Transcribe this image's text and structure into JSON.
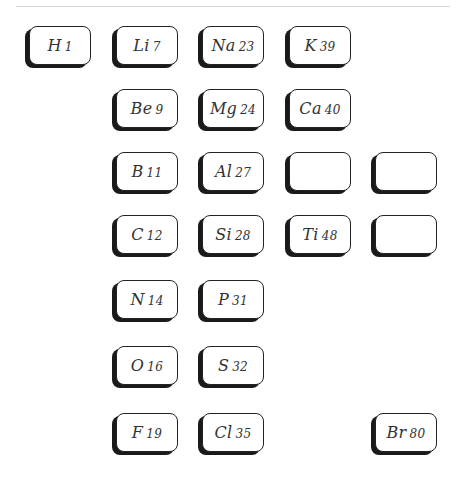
{
  "grid": {
    "col_x": [
      29,
      116,
      202,
      289,
      375
    ],
    "row_y": [
      26,
      89,
      152,
      215,
      280,
      346,
      413
    ]
  },
  "cards": [
    {
      "symbol": "H",
      "weight": "1",
      "col": 0,
      "row": 0
    },
    {
      "symbol": "Li",
      "weight": "7",
      "col": 1,
      "row": 0
    },
    {
      "symbol": "Na",
      "weight": "23",
      "col": 2,
      "row": 0
    },
    {
      "symbol": "K",
      "weight": "39",
      "col": 3,
      "row": 0
    },
    {
      "symbol": "Be",
      "weight": "9",
      "col": 1,
      "row": 1
    },
    {
      "symbol": "Mg",
      "weight": "24",
      "col": 2,
      "row": 1
    },
    {
      "symbol": "Ca",
      "weight": "40",
      "col": 3,
      "row": 1
    },
    {
      "symbol": "B",
      "weight": "11",
      "col": 1,
      "row": 2
    },
    {
      "symbol": "Al",
      "weight": "27",
      "col": 2,
      "row": 2
    },
    {
      "symbol": "",
      "weight": "",
      "col": 3,
      "row": 2
    },
    {
      "symbol": "",
      "weight": "",
      "col": 4,
      "row": 2
    },
    {
      "symbol": "C",
      "weight": "12",
      "col": 1,
      "row": 3
    },
    {
      "symbol": "Si",
      "weight": "28",
      "col": 2,
      "row": 3
    },
    {
      "symbol": "Ti",
      "weight": "48",
      "col": 3,
      "row": 3
    },
    {
      "symbol": "",
      "weight": "",
      "col": 4,
      "row": 3
    },
    {
      "symbol": "N",
      "weight": "14",
      "col": 1,
      "row": 4
    },
    {
      "symbol": "P",
      "weight": "31",
      "col": 2,
      "row": 4
    },
    {
      "symbol": "O",
      "weight": "16",
      "col": 1,
      "row": 5
    },
    {
      "symbol": "S",
      "weight": "32",
      "col": 2,
      "row": 5
    },
    {
      "symbol": "F",
      "weight": "19",
      "col": 1,
      "row": 6
    },
    {
      "symbol": "Cl",
      "weight": "35",
      "col": 2,
      "row": 6
    },
    {
      "symbol": "Br",
      "weight": "80",
      "col": 4,
      "row": 6
    }
  ]
}
